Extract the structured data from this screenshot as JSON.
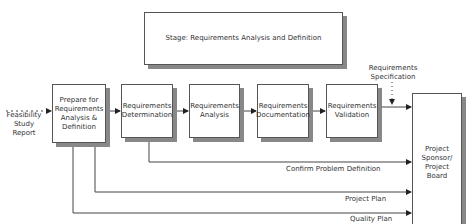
{
  "stage": {
    "title": "Stage: Requirements Analysis and Definition"
  },
  "inputs": {
    "feasibility": "Feasibility Study Report",
    "feasibility_lines": [
      "Feasibility",
      "Study",
      "Report"
    ]
  },
  "process_boxes": [
    {
      "id": "prepare",
      "lines": [
        "Prepare for",
        "Requirements",
        "Analysis &",
        "Definition"
      ]
    },
    {
      "id": "determination",
      "lines": [
        "Requirements",
        "Determination"
      ]
    },
    {
      "id": "analysis",
      "lines": [
        "Requirements",
        "Analysis"
      ]
    },
    {
      "id": "documentation",
      "lines": [
        "Requirements",
        "Documentation"
      ]
    },
    {
      "id": "validation",
      "lines": [
        "Requirements",
        "Validation"
      ]
    }
  ],
  "sponsor": {
    "lines": [
      "Project",
      "Sponsor/",
      "Project",
      "Board"
    ]
  },
  "outputs": {
    "requirements_spec": [
      "Requirements",
      "Specification"
    ],
    "confirm_problem": "Confirm Problem Definition",
    "project_plan": "Project Plan",
    "quality_plan": "Quality Plan"
  },
  "colors": {
    "line": "#444444",
    "shadow": "#888888",
    "border": "#555555"
  }
}
